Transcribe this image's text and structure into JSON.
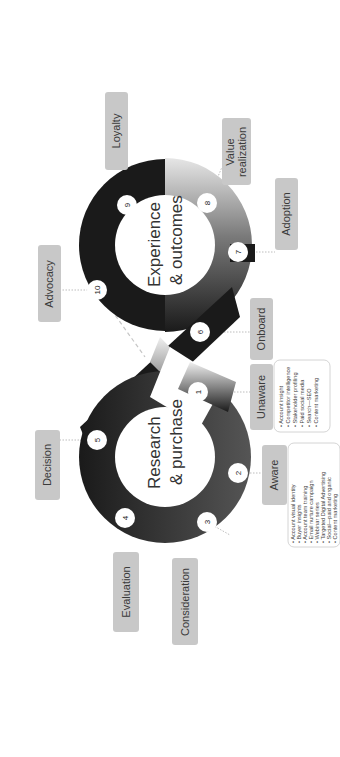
{
  "diagram": {
    "title_research": [
      "Research",
      "& purchase"
    ],
    "title_experience": [
      "Experience",
      "& outcomes"
    ],
    "colors": {
      "loop_dark": "#1a1a1a",
      "label_fill": "#c8c8c8",
      "box_border": "#c9c9c9",
      "connector": "#bdbdbd"
    },
    "steps": [
      {
        "n": "1",
        "stage": "Unaware",
        "items": [
          "Account insight",
          "Competitor intelligence",
          "Stakeholder profiling",
          "Paid social media",
          "Search—SEO",
          "Content marketing"
        ]
      },
      {
        "n": "2",
        "stage": "Aware",
        "items": [
          "Account visual identity",
          "Buyer insights",
          "Account team training",
          "Email nurture campaign",
          "Webinar series",
          "Targeted Digital Advertising",
          "Social—paid and organic",
          "Content marketing"
        ]
      },
      {
        "n": "3",
        "stage": "Consideration",
        "items": [
          "Value proposition and messaging",
          "Thought leadership",
          "Research based webinars",
          "Sales enablement",
          "Bespoke web pages",
          "Social selling",
          "Content marketing"
        ]
      },
      {
        "n": "4",
        "stage": "Evaluation",
        "items": [
          "Bespoke thought leadership",
          "Customised points of view",
          "Innovation workshop",
          "Bid support",
          "Social selling",
          "Focussed paid social and",
          "display advertising",
          "Content marketing"
        ]
      },
      {
        "n": "5",
        "stage": "Decision",
        "items": [
          "Innovation",
          "workshop",
          "Success stories",
          "Credentials",
          "Email marketing",
          "Organic social"
        ]
      },
      {
        "n": "6",
        "stage": "Onboard",
        "items": [
          "Credential",
          "development",
          "Hackathons",
          "Community of practice",
          "Email marketing",
          "Content marketing",
          "Organic social"
        ]
      },
      {
        "n": "7",
        "stage": "Adoption",
        "items": [
          "Credential development",
          "Community of practice",
          "Hackathons",
          "Email marketing",
          "Content marketing",
          "Organic social"
        ]
      },
      {
        "n": "8",
        "stage": "Value realization",
        "stage_lines": [
          "Value",
          "realization"
        ],
        "items": [
          "Award Submissions",
          "Credential development",
          "Community of practice",
          "Hackathons",
          "Email marketing",
          "Social selling",
          "Content marketing"
        ]
      },
      {
        "n": "9",
        "stage": "Loyalty",
        "items": [
          "Award Submissions",
          "Community of practice",
          "Hackathons",
          "Joint, local CSR activities",
          "Email marketing",
          "Social selling",
          "Content marketing"
        ]
      },
      {
        "n": "10",
        "stage": "Advocacy",
        "items": [
          "Client Partnership Review Report",
          "Customer champion support",
          "Webinars / lunch and learn sessions",
          "Sales assets",
          "Hospitality & speaker opportunities",
          "Joint CSR activities",
          "Email marketing",
          "Organic social"
        ]
      }
    ]
  }
}
